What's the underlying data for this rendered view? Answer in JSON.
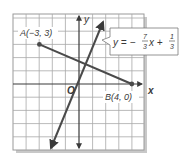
{
  "graph": {
    "x_axis_label": "x",
    "y_axis_label": "y",
    "origin_label": "O",
    "point_a": {
      "label": "A(−3, 3)",
      "x": -3,
      "y": 3
    },
    "point_b": {
      "label": "B(4, 0)",
      "x": 4,
      "y": 0
    },
    "equation": {
      "prefix": "y = −",
      "slope_num": "7",
      "slope_den": "3",
      "var": "x +",
      "int_num": "1",
      "int_den": "3"
    },
    "x_range": [
      -5,
      5
    ],
    "y_range": [
      -5,
      5
    ],
    "colors": {
      "grid": "#9a9a9a",
      "line": "#4a4a4a",
      "axis": "#3a3a3a"
    }
  }
}
